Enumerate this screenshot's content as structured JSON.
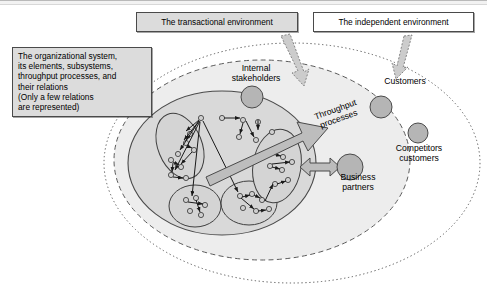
{
  "diagram": {
    "title_boxes": [
      {
        "id": "transactional",
        "label": "The transactional environment"
      },
      {
        "id": "independent",
        "label": "The independent environment"
      }
    ],
    "callout_org": "The organizational system,\nits elements, subsystems,\nthroughput processes, and\ntheir relations\n(Only a few relations\nare represented)",
    "labels": {
      "internal_stakeholders": "Internal\nstakeholders",
      "customers": "Customers",
      "competitors_customers": "Competitors\ncustomers",
      "business_partners": "Business\npartners",
      "throughput_processes": "Throughput\nprocesses"
    },
    "colors": {
      "outer_fill": "#ffffff",
      "transactional_fill": "#ededed",
      "organization_fill": "#d9d9d9",
      "node_fill": "#b5b5b5",
      "stroke": "#4a4a4a",
      "arrow_fill": "#bdbdbd",
      "callout_fill": "#dcdcdc",
      "page_background": "#ffffff"
    },
    "shapes": {
      "independent_ellipse": {
        "cx": 292,
        "cy": 163,
        "rx": 188,
        "ry": 120,
        "style": "dotted"
      },
      "transactional_ellipse": {
        "cx": 262,
        "cy": 160,
        "rx": 148,
        "ry": 100,
        "style": "dashed"
      },
      "organization_ellipse": {
        "cx": 222,
        "cy": 163,
        "rx": 94,
        "ry": 72,
        "style": "solid"
      },
      "subsystem_ellipses": [
        {
          "cx": 180,
          "cy": 146,
          "rx": 22,
          "ry": 33,
          "rot": -22
        },
        {
          "cx": 195,
          "cy": 205,
          "rx": 26,
          "ry": 21,
          "rot": 0
        },
        {
          "cx": 248,
          "cy": 202,
          "rx": 28,
          "ry": 22,
          "rot": 0
        },
        {
          "cx": 277,
          "cy": 165,
          "rx": 24,
          "ry": 36,
          "rot": 10
        }
      ],
      "big_nodes": [
        {
          "name": "internal-stakeholders-node",
          "cx": 252,
          "cy": 96,
          "r": 11
        },
        {
          "name": "customers-node",
          "cx": 381,
          "cy": 107,
          "r": 11
        },
        {
          "name": "competitors-customers-node",
          "cx": 418,
          "cy": 133,
          "r": 10
        },
        {
          "name": "business-partners-node",
          "cx": 349,
          "cy": 167,
          "r": 13
        }
      ]
    }
  }
}
